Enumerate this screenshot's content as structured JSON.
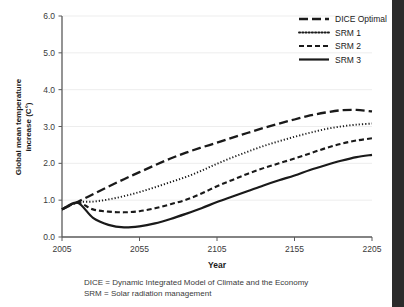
{
  "chart_data": {
    "type": "line",
    "title": "",
    "xlabel": "Year",
    "ylabel": "Global mean temperature increase (C°)",
    "ylabel_line1": "Global mean temperature",
    "ylabel_line2": "increase (C°)",
    "xlim": [
      2005,
      2205
    ],
    "ylim": [
      0.0,
      6.0
    ],
    "xticks": [
      2005,
      2055,
      2105,
      2155,
      2205
    ],
    "xtick_labels": [
      "2005",
      "2055",
      "2105",
      "2155",
      "2205"
    ],
    "yticks": [
      0.0,
      1.0,
      2.0,
      3.0,
      4.0,
      5.0,
      6.0
    ],
    "ytick_labels": [
      "0.0",
      "1.0",
      "2.0",
      "3.0",
      "4.0",
      "5.0",
      "6.0"
    ],
    "grid": true,
    "grid_axis": "y",
    "legend_position": "top-right",
    "x": [
      2005,
      2015,
      2025,
      2035,
      2045,
      2055,
      2065,
      2075,
      2085,
      2095,
      2105,
      2115,
      2125,
      2135,
      2145,
      2155,
      2165,
      2175,
      2185,
      2195,
      2205
    ],
    "series": [
      {
        "name": "DICE Optimal",
        "dash": "long-dash",
        "stroke_width": 2.3,
        "dasharray": "9,4",
        "color": "#1a1a1a",
        "values": [
          0.75,
          0.95,
          1.16,
          1.37,
          1.57,
          1.76,
          1.95,
          2.13,
          2.29,
          2.43,
          2.56,
          2.7,
          2.83,
          2.96,
          3.08,
          3.19,
          3.3,
          3.38,
          3.44,
          3.45,
          3.41
        ]
      },
      {
        "name": "SRM 1",
        "dash": "dotted",
        "stroke_width": 1.9,
        "dasharray": "1.2,2.0",
        "color": "#1a1a1a",
        "values": [
          0.75,
          0.94,
          0.96,
          1.02,
          1.11,
          1.22,
          1.35,
          1.49,
          1.63,
          1.8,
          1.99,
          2.16,
          2.32,
          2.47,
          2.6,
          2.72,
          2.83,
          2.93,
          3.0,
          3.05,
          3.08
        ]
      },
      {
        "name": "SRM 2",
        "dash": "dashed",
        "stroke_width": 2.1,
        "dasharray": "5,3",
        "color": "#1a1a1a",
        "values": [
          0.75,
          0.93,
          0.75,
          0.69,
          0.67,
          0.7,
          0.78,
          0.89,
          1.01,
          1.18,
          1.38,
          1.55,
          1.72,
          1.87,
          2.0,
          2.13,
          2.27,
          2.41,
          2.53,
          2.62,
          2.68
        ]
      },
      {
        "name": "SRM 3",
        "dash": "solid",
        "stroke_width": 2.2,
        "dasharray": "0",
        "color": "#1a1a1a",
        "values": [
          0.75,
          0.93,
          0.52,
          0.33,
          0.26,
          0.29,
          0.37,
          0.49,
          0.63,
          0.78,
          0.95,
          1.1,
          1.25,
          1.4,
          1.54,
          1.67,
          1.82,
          1.95,
          2.07,
          2.17,
          2.23
        ]
      }
    ],
    "annotations": [
      "DICE = Dynamic Integrated Model of Climate and the Economy",
      "SRM = Solar radiation management"
    ]
  },
  "footnotes": {
    "line1": "DICE = Dynamic Integrated Model of Climate and the Economy",
    "line2": "SRM = Solar radiation management"
  },
  "colors": {
    "ink": "#1a1a1a",
    "axis": "#5a5a5a",
    "grid": "#e8e8e8",
    "edge_band": "#2b2b2b",
    "background": "#ffffff"
  }
}
